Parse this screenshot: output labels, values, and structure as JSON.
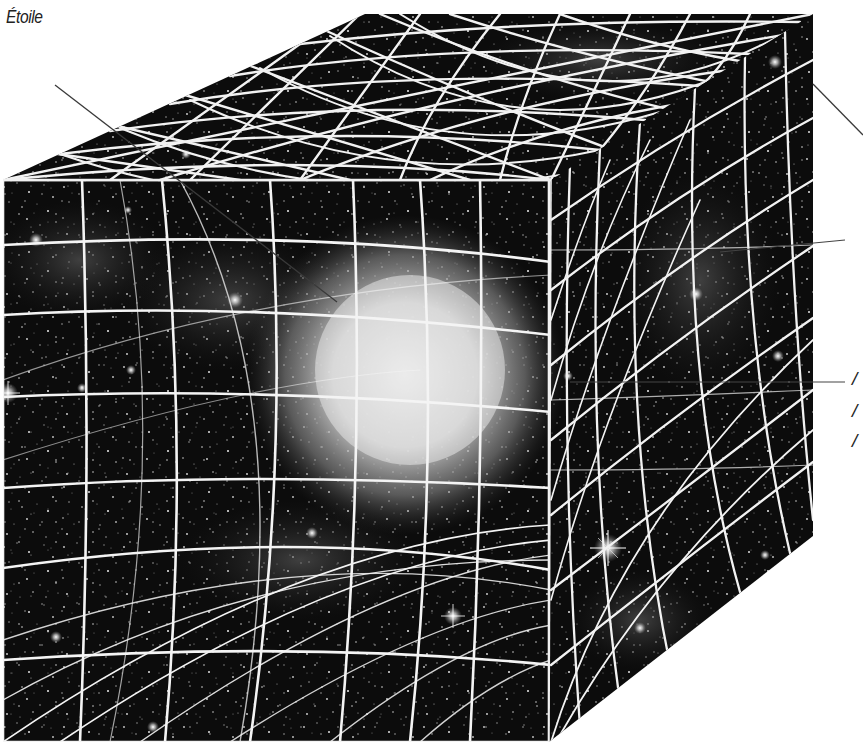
{
  "diagram": {
    "type": "spacetime-curvature-illustration",
    "colors": {
      "background": "#ffffff",
      "space": "#0b0b0b",
      "grid": "#f4f4f4",
      "star_glow": "#e8e8e8",
      "leader_line": "#3a3a3a",
      "label_text": "#222222"
    },
    "labels": [
      {
        "id": "star",
        "text": "Étoile",
        "x": 8,
        "y": 8
      },
      {
        "id": "right-label-1",
        "text": "",
        "visible_fragment": "cut off at right edge",
        "y": 250
      },
      {
        "id": "right-label-2",
        "text": "",
        "visible_fragment": "cut off at right edge",
        "y": 382
      }
    ],
    "partial_glyphs": [
      {
        "text": "/",
        "x": 853,
        "y": 372
      },
      {
        "text": "/",
        "x": 853,
        "y": 405
      },
      {
        "text": "/",
        "x": 853,
        "y": 436
      }
    ],
    "leaders": [
      {
        "from": [
          55,
          85
        ],
        "to": [
          337,
          302
        ],
        "target": "star"
      },
      {
        "from": [
          813,
          84
        ],
        "to": [
          863,
          135
        ],
        "target": "right-top"
      },
      {
        "from": [
          720,
          250
        ],
        "to": [
          845,
          240
        ],
        "target": "right-label-1"
      },
      {
        "from": [
          570,
          382
        ],
        "to": [
          845,
          382
        ],
        "target": "right-label-2"
      }
    ],
    "cube": {
      "front": [
        [
          3,
          180
        ],
        [
          551,
          180
        ],
        [
          549,
          742
        ],
        [
          3,
          742
        ]
      ],
      "top": [
        [
          3,
          180
        ],
        [
          365,
          14
        ],
        [
          813,
          14
        ],
        [
          551,
          180
        ]
      ],
      "right": [
        [
          551,
          180
        ],
        [
          813,
          14
        ],
        [
          813,
          536
        ],
        [
          549,
          742
        ]
      ]
    },
    "central_star": {
      "cx": 405,
      "cy": 375,
      "r": 150
    },
    "bright_stars": [
      {
        "x": 608,
        "y": 548,
        "size": 26
      },
      {
        "x": 453,
        "y": 616,
        "size": 18
      },
      {
        "x": 8,
        "y": 393,
        "size": 20
      },
      {
        "x": 36,
        "y": 240,
        "size": 14
      },
      {
        "x": 235,
        "y": 300,
        "size": 14
      },
      {
        "x": 131,
        "y": 370,
        "size": 10
      },
      {
        "x": 82,
        "y": 388,
        "size": 10
      },
      {
        "x": 696,
        "y": 294,
        "size": 12
      },
      {
        "x": 778,
        "y": 356,
        "size": 10
      },
      {
        "x": 640,
        "y": 628,
        "size": 10
      },
      {
        "x": 56,
        "y": 637,
        "size": 12
      },
      {
        "x": 153,
        "y": 727,
        "size": 12
      },
      {
        "x": 186,
        "y": 154,
        "size": 10
      },
      {
        "x": 312,
        "y": 533,
        "size": 12
      },
      {
        "x": 775,
        "y": 62,
        "size": 12
      },
      {
        "x": 568,
        "y": 376,
        "size": 10
      }
    ]
  }
}
